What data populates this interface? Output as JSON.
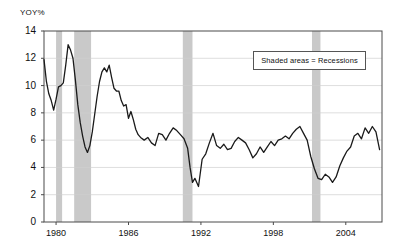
{
  "chart_data": {
    "type": "line",
    "title": "",
    "subtitle": "",
    "ylabel": "YOY%",
    "xlabel": "",
    "ylim": [
      0,
      14
    ],
    "xlim": [
      1979.0,
      2007.0
    ],
    "grid": "horizontal",
    "legend_position": "inside-top-right",
    "y_ticks": [
      0,
      2,
      4,
      6,
      8,
      10,
      12,
      14
    ],
    "y_tick_labels": [
      "0",
      "2",
      "4",
      "6",
      "8",
      "10",
      "12",
      "14"
    ],
    "x_ticks": [
      1980,
      1986,
      1992,
      1998,
      2004
    ],
    "x_tick_labels": [
      "1980",
      "1986",
      "1992",
      "1998",
      "2004"
    ],
    "annotations": [
      {
        "name": "recession-legend",
        "text": "Shaded areas = Recessions"
      }
    ],
    "shaded_regions": {
      "label": "Recessions",
      "color": "#c9c9c9",
      "spans": [
        {
          "start": 1980.0,
          "end": 1980.5
        },
        {
          "start": 1981.5,
          "end": 1982.9
        },
        {
          "start": 1990.5,
          "end": 1991.3
        },
        {
          "start": 2001.2,
          "end": 2001.9
        }
      ]
    },
    "series": [
      {
        "name": "YOY%",
        "color": "#1a1a1a",
        "x": [
          1979.0,
          1979.2,
          1979.4,
          1979.6,
          1979.8,
          1980.0,
          1980.2,
          1980.4,
          1980.6,
          1980.8,
          1981.0,
          1981.2,
          1981.4,
          1981.6,
          1981.8,
          1982.0,
          1982.2,
          1982.4,
          1982.6,
          1982.8,
          1983.0,
          1983.2,
          1983.4,
          1983.6,
          1983.8,
          1984.0,
          1984.2,
          1984.4,
          1984.6,
          1984.8,
          1985.0,
          1985.2,
          1985.4,
          1985.6,
          1985.8,
          1986.0,
          1986.2,
          1986.4,
          1986.6,
          1986.8,
          1987.0,
          1987.3,
          1987.6,
          1987.9,
          1988.2,
          1988.5,
          1988.8,
          1989.1,
          1989.4,
          1989.7,
          1990.0,
          1990.3,
          1990.6,
          1990.9,
          1991.1,
          1991.3,
          1991.5,
          1991.8,
          1992.1,
          1992.4,
          1992.7,
          1993.0,
          1993.3,
          1993.6,
          1993.9,
          1994.2,
          1994.5,
          1994.8,
          1995.1,
          1995.4,
          1995.7,
          1996.0,
          1996.3,
          1996.6,
          1996.9,
          1997.2,
          1997.5,
          1997.8,
          1998.1,
          1998.4,
          1998.7,
          1999.0,
          1999.3,
          1999.6,
          1999.9,
          2000.2,
          2000.5,
          2000.8,
          2001.1,
          2001.4,
          2001.7,
          2002.0,
          2002.3,
          2002.6,
          2002.9,
          2003.2,
          2003.5,
          2003.8,
          2004.1,
          2004.4,
          2004.7,
          2005.0,
          2005.3,
          2005.6,
          2005.9,
          2006.2,
          2006.5,
          2006.8
        ],
        "y": [
          11.9,
          10.3,
          9.4,
          8.9,
          8.2,
          9.0,
          9.9,
          10.0,
          10.2,
          11.5,
          13.0,
          12.6,
          12.0,
          10.4,
          8.6,
          7.3,
          6.3,
          5.5,
          5.1,
          5.6,
          6.6,
          7.9,
          9.2,
          10.3,
          11.0,
          11.3,
          11.0,
          11.5,
          10.6,
          9.8,
          9.6,
          9.6,
          8.9,
          8.5,
          8.6,
          7.6,
          8.1,
          7.5,
          6.8,
          6.4,
          6.2,
          6.0,
          6.2,
          5.8,
          5.6,
          6.5,
          6.4,
          6.0,
          6.5,
          6.9,
          6.7,
          6.4,
          6.1,
          5.4,
          4.0,
          2.9,
          3.2,
          2.6,
          4.6,
          5.0,
          5.8,
          6.5,
          5.6,
          5.4,
          5.7,
          5.3,
          5.4,
          5.9,
          6.2,
          6.0,
          5.8,
          5.3,
          4.7,
          5.0,
          5.5,
          5.1,
          5.5,
          5.9,
          5.6,
          6.0,
          6.1,
          6.3,
          6.1,
          6.5,
          6.8,
          7.0,
          6.5,
          6.0,
          4.8,
          3.9,
          3.2,
          3.1,
          3.5,
          3.3,
          2.9,
          3.3,
          4.1,
          4.7,
          5.2,
          5.5,
          6.3,
          6.5,
          6.1,
          6.9,
          6.5,
          7.0,
          6.6,
          5.3
        ]
      }
    ]
  },
  "axis": {
    "ylabel": "YOY%"
  },
  "legend": {
    "text": "Shaded areas = Recessions"
  }
}
